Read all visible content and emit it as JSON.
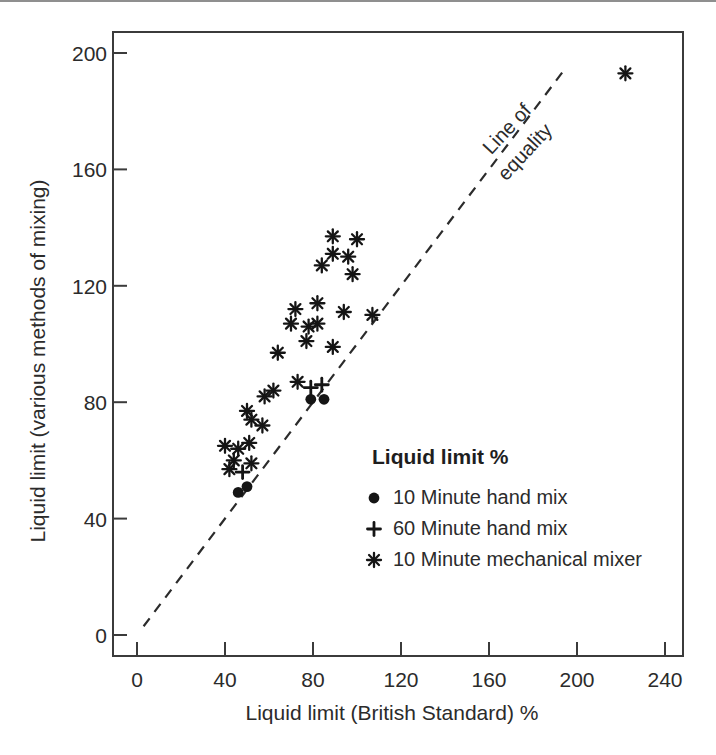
{
  "chart_data": {
    "type": "scatter",
    "title": "",
    "xlabel": "Liquid limit (British Standard) %",
    "ylabel": "Liquid limit (various methods of mixing)",
    "x_ticks": [
      0,
      40,
      80,
      120,
      160,
      200,
      240
    ],
    "y_ticks": [
      0,
      40,
      80,
      120,
      160,
      200
    ],
    "xlim": [
      -11,
      248
    ],
    "ylim": [
      -7,
      207
    ],
    "grid": false,
    "equality_line": {
      "from": [
        3,
        3
      ],
      "to": [
        194,
        194
      ],
      "style": "dashed",
      "label_line1": "Line of",
      "label_line2": "equality"
    },
    "legend_title": "Liquid limit %",
    "legend_position": "inside-lower-right",
    "series": [
      {
        "name": "10 Minute hand mix",
        "marker": "circle",
        "points": [
          [
            46,
            49
          ],
          [
            50,
            51
          ],
          [
            79,
            81
          ],
          [
            85,
            81
          ]
        ]
      },
      {
        "name": "60 Minute hand mix",
        "marker": "plus",
        "points": [
          [
            48,
            56
          ],
          [
            79,
            85
          ],
          [
            84,
            86
          ]
        ]
      },
      {
        "name": "10 Minute mechanical mixer",
        "marker": "asterisk",
        "points": [
          [
            40,
            65
          ],
          [
            42,
            57
          ],
          [
            44,
            60
          ],
          [
            46,
            64
          ],
          [
            51,
            66
          ],
          [
            52,
            59
          ],
          [
            50,
            77
          ],
          [
            52,
            74
          ],
          [
            57,
            72
          ],
          [
            58,
            82
          ],
          [
            62,
            84
          ],
          [
            73,
            87
          ],
          [
            64,
            97
          ],
          [
            70,
            107
          ],
          [
            72,
            112
          ],
          [
            77,
            101
          ],
          [
            78,
            106
          ],
          [
            82,
            107
          ],
          [
            82,
            114
          ],
          [
            89,
            99
          ],
          [
            94,
            111
          ],
          [
            107,
            110
          ],
          [
            84,
            127
          ],
          [
            89,
            131
          ],
          [
            89,
            137
          ],
          [
            96,
            130
          ],
          [
            98,
            124
          ],
          [
            100,
            136
          ],
          [
            222,
            193
          ]
        ]
      }
    ],
    "colors": {
      "marker": "#151515",
      "axis": "#3b3b3b",
      "text": "#2b2b2b",
      "dash_line": "#2b2b2b"
    }
  }
}
